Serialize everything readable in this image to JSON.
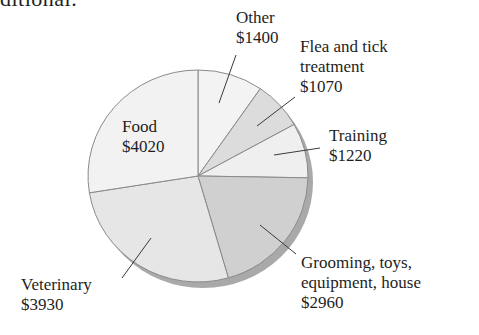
{
  "header": {
    "fragment": "ditional."
  },
  "chart_data": {
    "type": "pie",
    "title": "",
    "currency": "$",
    "categories": [
      "Other",
      "Flea and tick treatment",
      "Training",
      "Grooming, toys, equipment, house",
      "Veterinary",
      "Food"
    ],
    "values": [
      1400,
      1070,
      1220,
      2960,
      3930,
      4020
    ],
    "total": 14600,
    "start_angle_deg": 0,
    "direction": "clockwise from 12 o'clock",
    "colors": [
      "#f3f3f3",
      "#dcdcdc",
      "#efefef",
      "#d0d0d0",
      "#e6e6e6",
      "#f2f2f2"
    ],
    "shadow_color": "#a9a9a9",
    "legend": "none (direct labels with leader lines)"
  },
  "labels": {
    "other": {
      "name": "Other",
      "value": "$1400"
    },
    "flea": {
      "line1": "Flea and tick",
      "line2": "treatment",
      "value": "$1070"
    },
    "training": {
      "name": "Training",
      "value": "$1220"
    },
    "grooming": {
      "line1": "Grooming, toys,",
      "line2": "equipment, house",
      "value": "$2960"
    },
    "veterinary": {
      "name": "Veterinary",
      "value": "$3930"
    },
    "food": {
      "name": "Food",
      "value": "$4020"
    }
  }
}
